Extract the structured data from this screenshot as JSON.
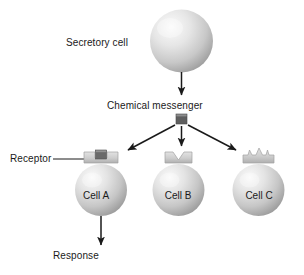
{
  "diagram": {
    "background_color": "#ffffff",
    "labels": {
      "secretory_cell": "Secretory cell",
      "chemical_messenger": "Chemical messenger",
      "receptor": "Receptor",
      "response": "Response"
    },
    "cells": [
      {
        "id": "cell-a",
        "label": "Cell A",
        "receptor_shape": "slot-matching",
        "messenger_bound": true
      },
      {
        "id": "cell-b",
        "label": "Cell B",
        "receptor_shape": "v-notch",
        "messenger_bound": false
      },
      {
        "id": "cell-c",
        "label": "Cell C",
        "receptor_shape": "crown-peaks",
        "messenger_bound": false
      }
    ],
    "colors": {
      "sphere_light": "#f2f2f2",
      "sphere_mid": "#d2d2d2",
      "sphere_dark": "#9a9a9a",
      "receptor_light": "#dcdcdc",
      "receptor_mid": "#c0c0c0",
      "receptor_dark": "#a8a8a8",
      "messenger_fill": "#606060",
      "messenger_top": "#8a8a8a",
      "arrow": "#1a1a1a",
      "text": "#1a1a1a"
    },
    "arrows": [
      {
        "name": "secretion-arrow",
        "from": "secretory-cell",
        "to": "chemical-messenger"
      },
      {
        "name": "messenger-to-cell-a-arrow",
        "from": "chemical-messenger",
        "to": "cell-a"
      },
      {
        "name": "messenger-to-cell-b-arrow",
        "from": "chemical-messenger",
        "to": "cell-b"
      },
      {
        "name": "messenger-to-cell-c-arrow",
        "from": "chemical-messenger",
        "to": "cell-c"
      },
      {
        "name": "response-arrow",
        "from": "cell-a",
        "to": "response"
      }
    ]
  }
}
